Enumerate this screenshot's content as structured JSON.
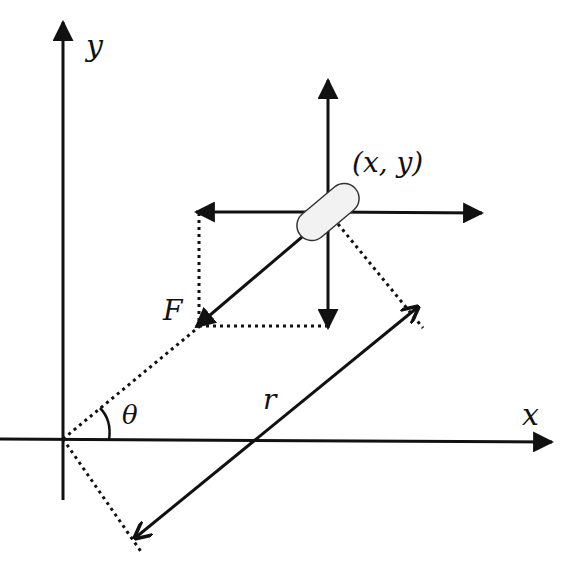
{
  "diagram": {
    "title": "",
    "labels": {
      "y_axis": "y",
      "x_axis": "x",
      "position": "(x, y)",
      "force": "F",
      "radius": "r",
      "angle": "θ"
    },
    "colors": {
      "stroke": "#111111",
      "pill_fill": "#f2f2f2",
      "pill_stroke": "#333333",
      "background": "#ffffff"
    },
    "elements": [
      "y-axis arrow",
      "x-axis arrow",
      "object (pill) at (x, y)",
      "up component arrow",
      "down component arrow",
      "left component arrow",
      "right component arrow",
      "force vector F",
      "dashed radial line from origin",
      "dashed component projection lines",
      "double-headed r arrow",
      "angle θ arc"
    ]
  }
}
